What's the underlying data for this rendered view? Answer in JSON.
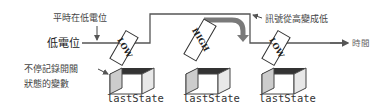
{
  "annotations": {
    "normally_low": "平時在低電位",
    "signal_high_to_low": "訊號從高變成低",
    "variable_note_line1": "不停記錄開關",
    "variable_note_line2": "狀態的變數"
  },
  "axis": {
    "low_level_label": "低電位",
    "time_label": "時間"
  },
  "boxes": [
    {
      "card": "LOW",
      "variable": "lastState"
    },
    {
      "card": "HIGH",
      "variable": "lastState"
    },
    {
      "card": "LOW",
      "variable": "lastState"
    }
  ],
  "colors": {
    "line": "#555555",
    "arrow": "#777777",
    "box_front": "#ffffff",
    "box_side": "#cccccc",
    "box_inside": "#333333"
  }
}
